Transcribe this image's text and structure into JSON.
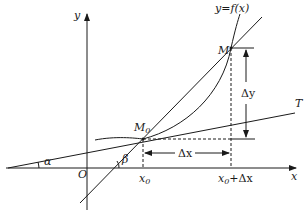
{
  "diagram": {
    "labels": {
      "y_axis": "y",
      "x_axis": "x",
      "origin": "O",
      "curve": "y=f(x)",
      "point_M": "M",
      "point_M0": "M",
      "point_M0_sub": "0",
      "tangent": "T",
      "delta_y": "Δy",
      "delta_x": "Δx",
      "x0": "x",
      "x0_sub": "0",
      "x0_plus_dx": "+Δx",
      "alpha": "α",
      "beta": "β"
    },
    "colors": {
      "stroke": "#1a1a1a",
      "background": "#ffffff"
    }
  }
}
